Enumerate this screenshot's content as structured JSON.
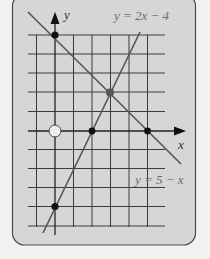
{
  "colors": {
    "background": "#f2f2f2",
    "card_fill": "#d6d6d6",
    "card_border": "#4a4a4a",
    "grid": "#3a3a3a",
    "axis": "#222222",
    "line": "#555555",
    "point": "#111111",
    "intersection_point": "#555555"
  },
  "axes": {
    "x_label": "x",
    "y_label": "y"
  },
  "lines": [
    {
      "equation": "y = 2x − 4",
      "label": "y = 2x − 4",
      "slope": 2,
      "intercept": -4
    },
    {
      "equation": "y = 5 − x",
      "label": "y = 5 − x",
      "slope": -1,
      "intercept": 5
    }
  ],
  "points": [
    {
      "name": "y-intercept of y = 5 − x",
      "x": 0,
      "y": 5,
      "style": "filled"
    },
    {
      "name": "intersection",
      "x": 3,
      "y": 2,
      "style": "filled-gray"
    },
    {
      "name": "x-intercept of y = 2x − 4",
      "x": 2,
      "y": 0,
      "style": "filled"
    },
    {
      "name": "x-intercept of y = 5 − x",
      "x": 5,
      "y": 0,
      "style": "filled"
    },
    {
      "name": "y-intercept of y = 2x − 4",
      "x": 0,
      "y": -4,
      "style": "filled"
    },
    {
      "name": "origin",
      "x": 0,
      "y": 0,
      "style": "open"
    }
  ],
  "grid": {
    "x_range": [
      -1,
      6
    ],
    "y_range": [
      -5,
      5
    ]
  }
}
